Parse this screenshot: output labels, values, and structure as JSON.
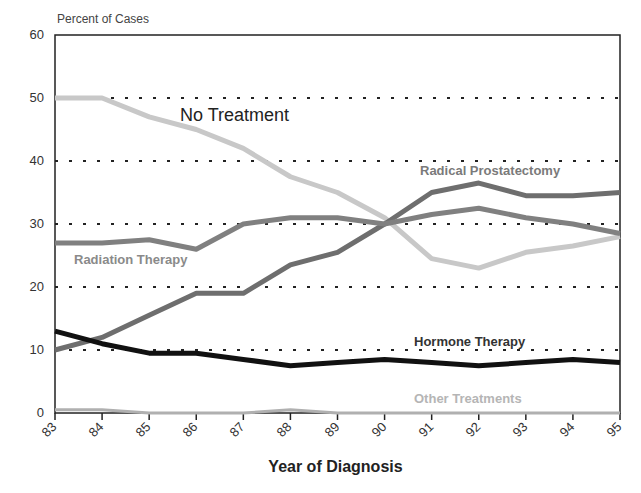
{
  "chart_data": {
    "type": "line",
    "title": "",
    "xlabel": "Year of Diagnosis",
    "ylabel": "Percent of Cases",
    "ylim": [
      0,
      60
    ],
    "yticks": [
      "0",
      "10",
      "20",
      "30",
      "40",
      "50",
      "60"
    ],
    "categories": [
      "83",
      "84",
      "85",
      "86",
      "87",
      "88",
      "89",
      "90",
      "91",
      "92",
      "93",
      "94",
      "95"
    ],
    "grid": "horizontal dotted at 10,20,30,40,50",
    "legend": "inline labels",
    "series": [
      {
        "name": "No Treatment",
        "color": "#c8c8c8",
        "values": [
          50,
          50,
          47,
          45,
          42,
          37.5,
          35,
          31,
          24.5,
          23,
          25.5,
          26.5,
          28
        ]
      },
      {
        "name": "Radical Prostatectomy",
        "color": "#6e6e6e",
        "values": [
          10,
          12,
          15.5,
          19,
          19,
          23.5,
          25.5,
          30,
          35,
          36.5,
          34.5,
          34.5,
          35
        ]
      },
      {
        "name": "Radiation Therapy",
        "color": "#808080",
        "values": [
          27,
          27,
          27.5,
          26,
          30,
          31,
          31,
          30,
          31.5,
          32.5,
          31,
          30,
          28.5
        ]
      },
      {
        "name": "Hormone Therapy",
        "color": "#111111",
        "values": [
          13,
          11,
          9.5,
          9.5,
          8.5,
          7.5,
          8,
          8.5,
          8,
          7.5,
          8,
          8.5,
          8
        ]
      },
      {
        "name": "Other Treatments",
        "color": "#b0b0b0",
        "values": [
          0.5,
          0.5,
          0,
          0,
          0,
          0.5,
          0,
          0,
          0,
          0,
          0,
          0,
          0
        ]
      }
    ],
    "annotations": [
      {
        "text": "No Treatment",
        "x": 180,
        "y": 105
      },
      {
        "text": "Radical Prostatectomy",
        "x": 420,
        "y": 165
      },
      {
        "text": "Radiation Therapy",
        "x": 74,
        "y": 253
      },
      {
        "text": "Hormone Therapy",
        "x": 414,
        "y": 335
      },
      {
        "text": "Other Treatments",
        "x": 414,
        "y": 393
      }
    ]
  },
  "labels": {
    "y_title": "Percent of Cases",
    "x_title": "Year of Diagnosis",
    "no_treatment": "No Treatment",
    "radical": "Radical Prostatectomy",
    "radiation": "Radiation Therapy",
    "hormone": "Hormone Therapy",
    "other": "Other Treatments"
  }
}
